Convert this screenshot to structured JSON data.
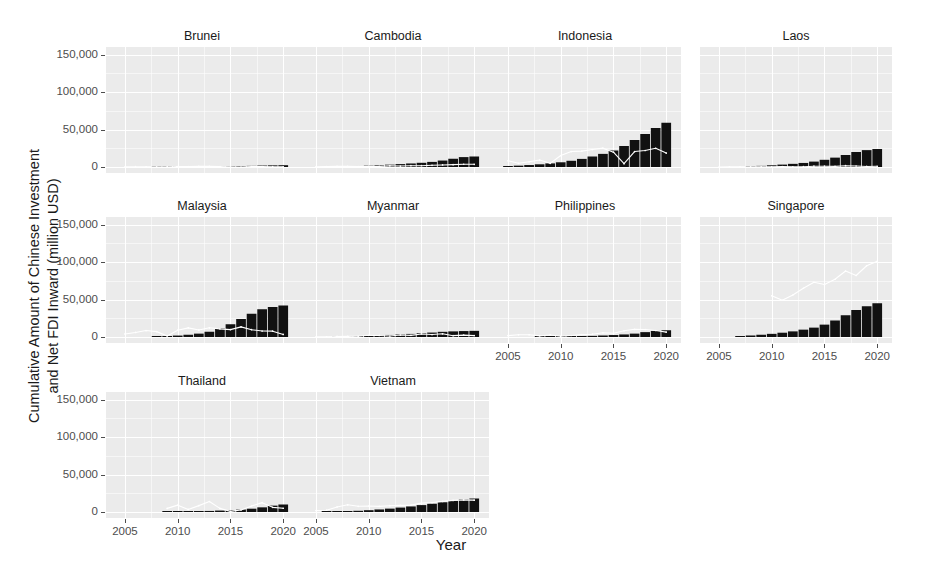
{
  "chart_data": {
    "type": "bar",
    "title": "",
    "xlabel": "Year",
    "ylabel": "Cumulative Amount of Chinese Investment and Net FDI Inward (million USD)",
    "ylabel_line1": "Cumulative Amount of Chinese Investment",
    "ylabel_line2": "and Net FDI Inward (million USD)",
    "facet_variable": "country",
    "grid": true,
    "legend_position": "none",
    "xlim": [
      2003.2,
      2021.4
    ],
    "ylim": [
      -8000,
      160000
    ],
    "x_ticks": [
      2005,
      2010,
      2015,
      2020
    ],
    "x_tick_labels": [
      "2005",
      "2010",
      "2015",
      "2020"
    ],
    "y_ticks": [
      0,
      50000,
      100000,
      150000
    ],
    "y_tick_labels": [
      "0",
      "50,000",
      "100,000",
      "150,000"
    ],
    "series_names": [
      "Cumulative Chinese Investment (bars)",
      "Net FDI Inward (line)"
    ],
    "bar_color": "#111111",
    "line_color": "#ffffff",
    "panel_background": "#ebebeb",
    "gridline_color": "#ffffff",
    "years": [
      2005,
      2006,
      2007,
      2008,
      2009,
      2010,
      2011,
      2012,
      2013,
      2014,
      2015,
      2016,
      2017,
      2018,
      2019,
      2020
    ],
    "panels": [
      {
        "country": "Brunei",
        "row": 1,
        "col": 1,
        "bars": {
          "x": [
            2008,
            2009,
            2010,
            2011,
            2012,
            2013,
            2014,
            2015,
            2016,
            2017,
            2018,
            2019,
            2020
          ],
          "y": [
            300,
            400,
            500,
            600,
            700,
            800,
            900,
            1000,
            1200,
            1500,
            1900,
            2200,
            2400
          ]
        },
        "line": {
          "x": [
            2005,
            2006,
            2007,
            2008,
            2009,
            2010,
            2011,
            2012,
            2013,
            2014,
            2015,
            2016,
            2017,
            2018,
            2019,
            2020
          ],
          "y": [
            290,
            400,
            260,
            330,
            370,
            480,
            690,
            850,
            780,
            570,
            170,
            -150,
            460,
            510,
            370,
            280
          ]
        }
      },
      {
        "country": "Cambodia",
        "row": 1,
        "col": 2,
        "bars": {
          "x": [
            2007,
            2008,
            2009,
            2010,
            2011,
            2012,
            2013,
            2014,
            2015,
            2016,
            2017,
            2018,
            2019,
            2020
          ],
          "y": [
            600,
            900,
            1300,
            1800,
            2400,
            3100,
            3900,
            4700,
            5600,
            6800,
            8600,
            11000,
            13200,
            14000
          ]
        },
        "line": {
          "x": [
            2005,
            2006,
            2007,
            2008,
            2009,
            2010,
            2011,
            2012,
            2013,
            2014,
            2015,
            2016,
            2017,
            2018,
            2019,
            2020
          ],
          "y": [
            380,
            480,
            870,
            820,
            540,
            780,
            900,
            1560,
            1270,
            1730,
            1700,
            2280,
            2730,
            3100,
            3660,
            3620
          ]
        }
      },
      {
        "country": "Indonesia",
        "row": 1,
        "col": 3,
        "bars": {
          "x": [
            2005,
            2006,
            2007,
            2008,
            2009,
            2010,
            2011,
            2012,
            2013,
            2014,
            2015,
            2016,
            2017,
            2018,
            2019,
            2020
          ],
          "y": [
            1200,
            1800,
            2600,
            3600,
            4800,
            6300,
            8300,
            10800,
            14000,
            17500,
            22000,
            28000,
            36000,
            44000,
            52000,
            59000
          ]
        },
        "line": {
          "x": [
            2005,
            2006,
            2007,
            2008,
            2009,
            2010,
            2011,
            2012,
            2013,
            2014,
            2015,
            2016,
            2017,
            2018,
            2019,
            2020
          ],
          "y": [
            8300,
            4900,
            6900,
            9300,
            4900,
            15300,
            20600,
            21200,
            23300,
            25100,
            19800,
            4500,
            20600,
            22000,
            24900,
            18600
          ]
        }
      },
      {
        "country": "Laos",
        "row": 1,
        "col": 4,
        "bars": {
          "x": [
            2008,
            2009,
            2010,
            2011,
            2012,
            2013,
            2014,
            2015,
            2016,
            2017,
            2018,
            2019,
            2020
          ],
          "y": [
            900,
            1500,
            2300,
            3200,
            4200,
            5400,
            7200,
            9600,
            12500,
            16000,
            20000,
            22500,
            24000
          ]
        },
        "line": {
          "x": [
            2005,
            2006,
            2007,
            2008,
            2009,
            2010,
            2011,
            2012,
            2013,
            2014,
            2015,
            2016,
            2017,
            2018,
            2019,
            2020
          ],
          "y": [
            30,
            190,
            320,
            230,
            320,
            330,
            470,
            290,
            430,
            1080,
            1070,
            900,
            1700,
            1360,
            760,
            970
          ]
        }
      },
      {
        "country": "Malaysia",
        "row": 2,
        "col": 1,
        "bars": {
          "x": [
            2008,
            2009,
            2010,
            2011,
            2012,
            2013,
            2014,
            2015,
            2016,
            2017,
            2018,
            2019,
            2020
          ],
          "y": [
            600,
            1100,
            1900,
            3000,
            4500,
            7000,
            11500,
            17000,
            24000,
            31000,
            37000,
            40000,
            42000
          ]
        },
        "line": {
          "x": [
            2005,
            2006,
            2007,
            2008,
            2009,
            2010,
            2011,
            2012,
            2013,
            2014,
            2015,
            2016,
            2017,
            2018,
            2019,
            2020
          ],
          "y": [
            4060,
            6060,
            8590,
            7170,
            1450,
            9060,
            12200,
            9400,
            12300,
            10900,
            9860,
            13500,
            9700,
            8000,
            7800,
            3400
          ]
        }
      },
      {
        "country": "Myanmar",
        "row": 2,
        "col": 2,
        "bars": {
          "x": [
            2007,
            2008,
            2009,
            2010,
            2011,
            2012,
            2013,
            2014,
            2015,
            2016,
            2017,
            2018,
            2019,
            2020
          ],
          "y": [
            300,
            600,
            1000,
            1500,
            2100,
            2700,
            3400,
            4100,
            5000,
            5900,
            6900,
            7500,
            7900,
            8200
          ]
        },
        "line": {
          "x": [
            2005,
            2006,
            2007,
            2008,
            2009,
            2010,
            2011,
            2012,
            2013,
            2014,
            2015,
            2016,
            2017,
            2018,
            2019,
            2020
          ],
          "y": [
            235,
            275,
            710,
            860,
            960,
            2250,
            2060,
            1350,
            2620,
            2180,
            4080,
            3280,
            4300,
            1770,
            2510,
            1900
          ]
        }
      },
      {
        "country": "Philippines",
        "row": 2,
        "col": 3,
        "bars": {
          "x": [
            2008,
            2009,
            2010,
            2011,
            2012,
            2013,
            2014,
            2015,
            2016,
            2017,
            2018,
            2019,
            2020
          ],
          "y": [
            200,
            350,
            550,
            800,
            1100,
            1500,
            2000,
            2600,
            3400,
            4500,
            6500,
            8200,
            9000
          ]
        },
        "line": {
          "x": [
            2005,
            2006,
            2007,
            2008,
            2009,
            2010,
            2011,
            2012,
            2013,
            2014,
            2015,
            2016,
            2017,
            2018,
            2019,
            2020
          ],
          "y": [
            1850,
            2920,
            2920,
            1540,
            2710,
            1070,
            2010,
            3220,
            3740,
            5640,
            4930,
            8280,
            10260,
            9950,
            8670,
            6540
          ]
        }
      },
      {
        "country": "Singapore",
        "row": 2,
        "col": 4,
        "bars": {
          "x": [
            2007,
            2008,
            2009,
            2010,
            2011,
            2012,
            2013,
            2014,
            2015,
            2016,
            2017,
            2018,
            2019,
            2020
          ],
          "y": [
            1200,
            2000,
            3000,
            4200,
            5700,
            7500,
            9800,
            12500,
            16500,
            22000,
            29000,
            36000,
            41000,
            45000
          ]
        },
        "line": {
          "x": [
            2010,
            2011,
            2012,
            2013,
            2014,
            2015,
            2016,
            2017,
            2018,
            2019,
            2020
          ],
          "y": [
            55000,
            49000,
            56000,
            65000,
            73000,
            70000,
            77000,
            88000,
            82000,
            95000,
            101000
          ]
        }
      },
      {
        "country": "Thailand",
        "row": 3,
        "col": 1,
        "bars": {
          "x": [
            2009,
            2010,
            2011,
            2012,
            2013,
            2014,
            2015,
            2016,
            2017,
            2018,
            2019,
            2020
          ],
          "y": [
            250,
            450,
            700,
            1000,
            1400,
            1900,
            2500,
            3300,
            4400,
            6200,
            8500,
            10000
          ]
        },
        "line": {
          "x": [
            2009,
            2010,
            2011,
            2012,
            2013,
            2014,
            2015,
            2016,
            2017,
            2018,
            2019,
            2020
          ],
          "y": [
            4800,
            9150,
            3400,
            8500,
            14000,
            4800,
            800,
            2800,
            8000,
            12500,
            6200,
            5000
          ]
        }
      },
      {
        "country": "Vietnam",
        "row": 3,
        "col": 2,
        "bars": {
          "x": [
            2006,
            2007,
            2008,
            2009,
            2010,
            2011,
            2012,
            2013,
            2014,
            2015,
            2016,
            2017,
            2018,
            2019,
            2020
          ],
          "y": [
            300,
            600,
            1000,
            1600,
            2400,
            3400,
            4500,
            5900,
            7400,
            9200,
            11000,
            13000,
            15000,
            17000,
            18000
          ]
        },
        "line": {
          "x": [
            2005,
            2006,
            2007,
            2008,
            2009,
            2010,
            2011,
            2012,
            2013,
            2014,
            2015,
            2016,
            2017,
            2018,
            2019,
            2020
          ],
          "y": [
            1950,
            2400,
            6700,
            9580,
            7600,
            8000,
            7519,
            8368,
            8900,
            9200,
            11800,
            12600,
            14100,
            15500,
            16120,
            15800
          ]
        }
      }
    ]
  }
}
